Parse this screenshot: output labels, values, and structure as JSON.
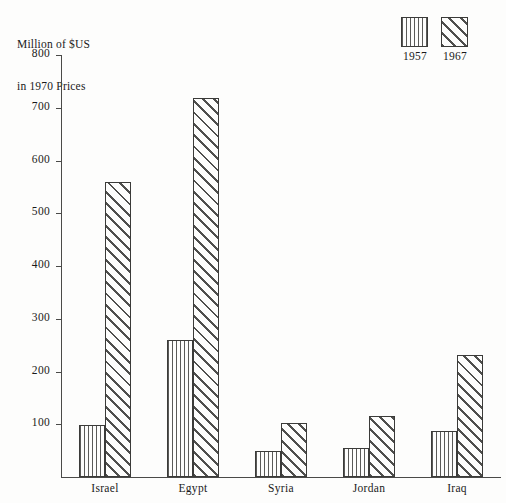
{
  "chart_data": {
    "type": "bar",
    "title": "Million of $US\nin 1970 Prices",
    "title_line1": "Million of $US",
    "title_line2": "in 1970 Prices",
    "xlabel": "",
    "ylabel": "Million of $US in 1970 Prices",
    "ylim": [
      0,
      800
    ],
    "yticks": [
      100,
      200,
      300,
      400,
      500,
      600,
      700,
      800
    ],
    "ytick_labels": [
      "100",
      "200",
      "300",
      "400",
      "500",
      "600",
      "700",
      "800"
    ],
    "grid": false,
    "legend_position": "top-right",
    "categories": [
      "Israel",
      "Egypt",
      "Syria",
      "Jordan",
      "Iraq"
    ],
    "series": [
      {
        "name": "1957",
        "values": [
          98,
          260,
          49,
          55,
          87
        ]
      },
      {
        "name": "1967",
        "values": [
          560,
          718,
          103,
          115,
          232
        ]
      }
    ]
  }
}
